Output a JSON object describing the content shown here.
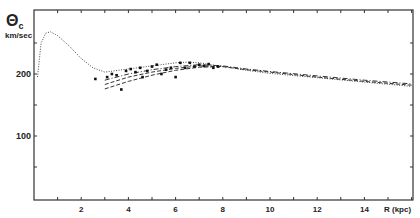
{
  "chart_data": {
    "type": "line",
    "title": "",
    "ylabel_symbol": "Θc",
    "ylabel_unit": "km/sec",
    "xlabel": "R (kpc)",
    "xlim": [
      0,
      16.5
    ],
    "ylim": [
      0,
      280
    ],
    "xticks": [
      2,
      4,
      6,
      8,
      10,
      12,
      14
    ],
    "yticks": [
      100,
      200
    ],
    "grid": false,
    "legend": "none",
    "series": [
      {
        "name": "model-dotted",
        "style": "dotted",
        "x": [
          0.15,
          0.3,
          0.5,
          0.7,
          1.0,
          1.5,
          2.0,
          2.5,
          3.0,
          4.0,
          5.0,
          6.0,
          6.5,
          7.0,
          8.0,
          9.0,
          10.0,
          12.0,
          14.0,
          16.0
        ],
        "y": [
          195,
          250,
          266,
          268,
          262,
          245,
          225,
          210,
          203,
          208,
          213,
          218,
          219,
          218,
          212,
          206,
          201,
          194,
          187,
          180
        ]
      },
      {
        "name": "model-dashdot",
        "style": "dashdot",
        "x": [
          3.0,
          4.0,
          5.0,
          6.0,
          7.0,
          8.0,
          9.0,
          10.0,
          12.0,
          14.0,
          16.0
        ],
        "y": [
          190,
          200,
          207,
          212,
          215,
          213,
          208,
          204,
          197,
          190,
          184
        ]
      },
      {
        "name": "model-dashed-1",
        "style": "dashed",
        "x": [
          3.0,
          4.0,
          5.0,
          6.0,
          7.0,
          8.0,
          9.0,
          10.0,
          12.0,
          14.0,
          16.0
        ],
        "y": [
          183,
          195,
          203,
          209,
          213,
          212,
          207,
          203,
          195,
          188,
          182
        ]
      },
      {
        "name": "model-dashed-2",
        "style": "dashed",
        "x": [
          3.0,
          4.0,
          5.0,
          6.0,
          7.0,
          8.0
        ],
        "y": [
          176,
          188,
          198,
          206,
          211,
          212
        ]
      }
    ],
    "points": {
      "name": "observed",
      "marker": "square",
      "x": [
        2.6,
        3.1,
        3.3,
        3.5,
        3.7,
        3.9,
        4.1,
        4.3,
        4.5,
        4.6,
        4.8,
        5.0,
        5.2,
        5.4,
        5.6,
        5.8,
        6.0,
        6.2,
        6.4,
        6.6,
        6.8,
        7.0,
        7.2,
        7.4,
        7.6,
        7.8
      ],
      "y": [
        192,
        195,
        200,
        198,
        175,
        205,
        208,
        203,
        210,
        195,
        205,
        212,
        215,
        200,
        207,
        210,
        195,
        218,
        210,
        218,
        212,
        215,
        213,
        216,
        210,
        212
      ]
    }
  }
}
